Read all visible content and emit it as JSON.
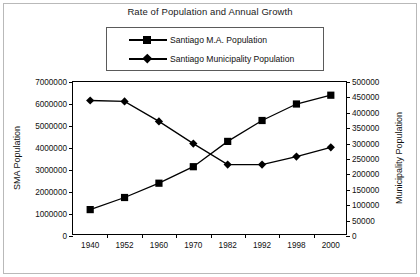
{
  "chart_data": {
    "type": "line",
    "title": "Rate of Population and Annual Growth",
    "xlabel": "",
    "ylabel": "SMA Population",
    "y2label": "Municipality Population",
    "categories": [
      "1940",
      "1952",
      "1960",
      "1970",
      "1982",
      "1992",
      "1998",
      "2000"
    ],
    "ylim": [
      0,
      7000000
    ],
    "y2lim": [
      0,
      500000
    ],
    "yticks": [
      "0",
      "1000000",
      "2000000",
      "3000000",
      "4000000",
      "5000000",
      "6000000",
      "7000000"
    ],
    "y2ticks": [
      "0",
      "50000",
      "100000",
      "150000",
      "200000",
      "250000",
      "300000",
      "350000",
      "400000",
      "450000",
      "500000"
    ],
    "grid": false,
    "legend_position": "top",
    "series": [
      {
        "name": "Santiago M.A. Population",
        "axis": "left",
        "marker": "square",
        "color": "#000000",
        "values": [
          1200000,
          1750000,
          2400000,
          3150000,
          4300000,
          5250000,
          6000000,
          6400000
        ]
      },
      {
        "name": "Santiago Municipality Population",
        "axis": "right",
        "marker": "diamond",
        "color": "#000000",
        "values": [
          440000,
          437000,
          372000,
          300000,
          232000,
          232000,
          258000,
          288000
        ]
      }
    ]
  }
}
